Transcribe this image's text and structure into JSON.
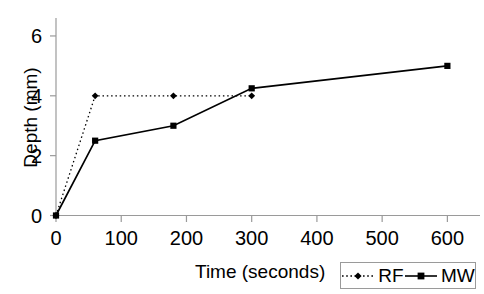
{
  "chart_data": {
    "type": "line",
    "title": "",
    "xlabel": "Time (seconds)",
    "ylabel": "Depth (mm)",
    "xlim": [
      0,
      650
    ],
    "ylim": [
      0,
      6.6
    ],
    "xticks": [
      0,
      100,
      200,
      300,
      400,
      500,
      600
    ],
    "xtick_labels": [
      "0",
      "100",
      "200",
      "300",
      "400",
      "500",
      "600"
    ],
    "yticks": [
      0,
      2,
      4,
      6
    ],
    "ytick_labels": [
      "0",
      "2",
      "4",
      "6"
    ],
    "grid": false,
    "legend_position": "bottom-right",
    "series": [
      {
        "name": "RF",
        "marker": "diamond",
        "linestyle": "dotted",
        "color": "#000000",
        "x": [
          0,
          60,
          180,
          300
        ],
        "y": [
          0,
          4.0,
          4.0,
          4.0
        ]
      },
      {
        "name": "MW",
        "marker": "square",
        "linestyle": "solid",
        "color": "#000000",
        "x": [
          0,
          60,
          180,
          300,
          600
        ],
        "y": [
          0,
          2.5,
          3.0,
          4.25,
          5.0
        ]
      }
    ]
  },
  "legend": {
    "entries": [
      {
        "label": "RF"
      },
      {
        "label": "MW"
      }
    ]
  },
  "colors": {
    "axis": "#9a9a9a",
    "series": "#000000",
    "background": "#ffffff",
    "legend_border": "#9a9a9a"
  },
  "icons": {
    "rf_marker": "diamond-marker-icon",
    "mw_marker": "square-marker-icon"
  }
}
